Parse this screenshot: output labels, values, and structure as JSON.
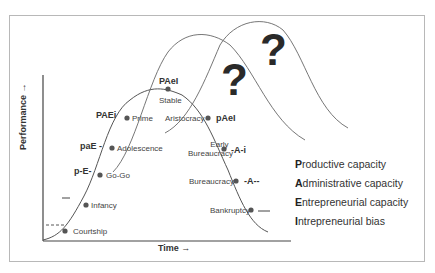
{
  "diagram": {
    "axes": {
      "y_label": "Performance →",
      "x_label": "Time →"
    },
    "stages": [
      {
        "name": "Courtship",
        "code": "- - - -"
      },
      {
        "name": "Infancy",
        "code": "--e-"
      },
      {
        "name": "Go-Go",
        "code": "p-E-"
      },
      {
        "name": "Adolescence",
        "code": "paE -"
      },
      {
        "name": "Prime",
        "code": "PAEi"
      },
      {
        "name": "Stable",
        "code": "PAeI"
      },
      {
        "name": "Aristocracy",
        "code": "pAeI"
      },
      {
        "name": "Early Bureaucracy",
        "name_line1": "Early",
        "name_line2": "Bureaucracy",
        "code": "-A-i"
      },
      {
        "name": "Bureaucracy",
        "code": "-A--"
      },
      {
        "name": "Bankruptcy",
        "code": "----"
      }
    ],
    "question_marks": [
      "?",
      "?"
    ],
    "legend": [
      {
        "initial": "P",
        "rest": "roductive capacity"
      },
      {
        "initial": "A",
        "rest": "dministrative capacity"
      },
      {
        "initial": "E",
        "rest": "ntrepreneurial capacity"
      },
      {
        "initial": "I",
        "rest": "ntrepreneurial bias"
      }
    ],
    "colors": {
      "curve": "#555555",
      "dot": "#555555",
      "frame": "#b8b8b8",
      "text": "#333333"
    }
  }
}
